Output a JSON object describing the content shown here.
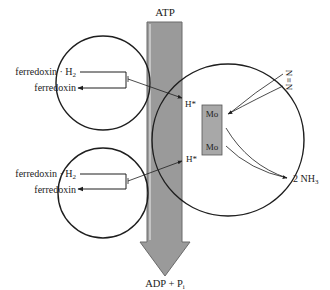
{
  "diagram": {
    "top_label": "ATP",
    "bottom_label_main": "ADP + P",
    "bottom_label_sub": "i",
    "upper_complex": {
      "input_label_main": "ferredoxin · H",
      "input_label_sub": "2",
      "output_label": "ferredoxin",
      "hydrogen_label": "H*"
    },
    "lower_complex": {
      "input_label_main": "ferredoxin · H",
      "input_label_sub": "2",
      "output_label": "ferredoxin",
      "hydrogen_label": "H*"
    },
    "metal_center": {
      "top_label": "Mo",
      "bottom_label": "Mo"
    },
    "substrate_label": "N≡N",
    "substrate_atom_top": "N",
    "substrate_bond": "≡",
    "substrate_atom_bottom": "N",
    "product_label_main": "2 NH",
    "product_label_sub": "3"
  },
  "colors": {
    "energy_arrow_fill": "#9a9a9a",
    "energy_arrow_stroke": "#6a6a6a",
    "mo_box_fill": "#a8a8a8",
    "line": "#1e1e1e",
    "background": "#ffffff"
  }
}
